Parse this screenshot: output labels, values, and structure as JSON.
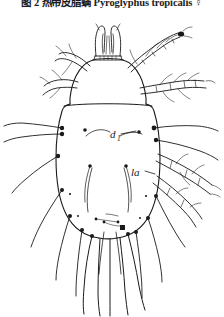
{
  "caption": {
    "chinese_prefix": "图 2  热带皮脂螨",
    "species_name": "Pyroglyphus tropicalis",
    "sex_symbol": "♀",
    "full_text": "图 2  热带皮脂螨 Pyroglyphus tropicalis ♀"
  },
  "figure": {
    "view": "dorsal",
    "ink_color": "#1a1a1a",
    "background_color": "#ffffff",
    "labels": [
      {
        "id": "d1",
        "text": "d",
        "subscript": "1",
        "x": 112,
        "y": 126
      },
      {
        "id": "la",
        "text": "la",
        "subscript": "",
        "x": 133,
        "y": 164
      }
    ],
    "parts": [
      "gnathosoma",
      "propodosoma",
      "hysterosoma",
      "sejugal-furrow",
      "leg-I",
      "leg-II",
      "leg-III",
      "leg-IV",
      "dorsal-setae",
      "posterior-setae"
    ]
  }
}
